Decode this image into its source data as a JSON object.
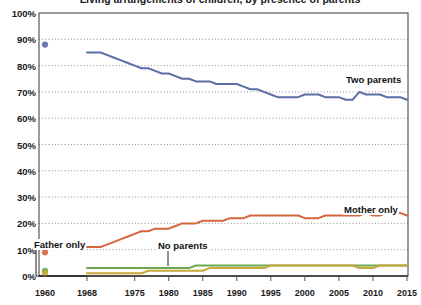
{
  "title": "Living arrangements of children, by presence of parents",
  "axes": {
    "y_ticks": [
      "100%",
      "90%",
      "80%",
      "70%",
      "60%",
      "50%",
      "40%",
      "30%",
      "20%",
      "10%",
      "0%"
    ],
    "x_ticks": [
      "1960",
      "1968",
      "1975",
      "1980",
      "1985",
      "1990",
      "1995",
      "2000",
      "2005",
      "2010",
      "2015"
    ]
  },
  "annotations": {
    "two_parents": "Two parents",
    "mother_only": "Mother only",
    "father_only": "Father only",
    "no_parents": "No parents"
  },
  "colors": {
    "two_parents": "#5b6ea6",
    "mother_only": "#d4673f",
    "father_only": "#c9a63a",
    "no_parents": "#6aa84f",
    "grid": "#7a7a7a",
    "axis": "#4a4a4a"
  },
  "chart_data": {
    "type": "line",
    "title": "Living arrangements of children, by presence of parents",
    "xlabel": "",
    "ylabel": "Percent of children",
    "ylim": [
      0,
      100
    ],
    "grid": true,
    "legend": "inline-annotations",
    "x_axis_ticks": [
      1960,
      1968,
      1975,
      1980,
      1985,
      1990,
      1995,
      2000,
      2005,
      2010,
      2015
    ],
    "y_axis_ticks": [
      0,
      10,
      20,
      30,
      40,
      50,
      60,
      70,
      80,
      90,
      100
    ],
    "note": "1960 values shown as isolated markers; continuous series begin in 1968",
    "isolated_points_1960": [
      {
        "series": "Two parents",
        "x": 1960,
        "y": 88
      },
      {
        "series": "Mother only",
        "x": 1960,
        "y": 9
      },
      {
        "series": "No parents",
        "x": 1960,
        "y": 2
      },
      {
        "series": "Father only",
        "x": 1960,
        "y": 1
      }
    ],
    "x": [
      1968,
      1969,
      1970,
      1971,
      1972,
      1973,
      1974,
      1975,
      1976,
      1977,
      1978,
      1979,
      1980,
      1981,
      1982,
      1983,
      1984,
      1985,
      1986,
      1987,
      1988,
      1989,
      1990,
      1991,
      1992,
      1993,
      1994,
      1995,
      1996,
      1997,
      1998,
      1999,
      2000,
      2001,
      2002,
      2003,
      2004,
      2005,
      2006,
      2007,
      2008,
      2009,
      2010,
      2011,
      2012,
      2013,
      2014,
      2015
    ],
    "series": [
      {
        "name": "Two parents",
        "color": "#5b6ea6",
        "values": [
          85,
          85,
          85,
          84,
          83,
          82,
          81,
          80,
          79,
          79,
          78,
          77,
          77,
          76,
          75,
          75,
          74,
          74,
          74,
          73,
          73,
          73,
          73,
          72,
          71,
          71,
          70,
          69,
          68,
          68,
          68,
          68,
          69,
          69,
          69,
          68,
          68,
          68,
          67,
          67,
          70,
          69,
          69,
          69,
          68,
          68,
          68,
          67
        ]
      },
      {
        "name": "Mother only",
        "color": "#d4673f",
        "values": [
          11,
          11,
          11,
          12,
          13,
          14,
          15,
          16,
          17,
          17,
          18,
          18,
          18,
          19,
          20,
          20,
          20,
          21,
          21,
          21,
          21,
          22,
          22,
          22,
          23,
          23,
          23,
          23,
          23,
          23,
          23,
          23,
          22,
          22,
          22,
          23,
          23,
          23,
          23,
          23,
          23,
          24,
          23,
          23,
          24,
          24,
          24,
          23
        ]
      },
      {
        "name": "Father only",
        "color": "#c9a63a",
        "values": [
          1,
          1,
          1,
          1,
          1,
          1,
          1,
          1,
          1,
          2,
          2,
          2,
          2,
          2,
          2,
          2,
          2,
          2,
          3,
          3,
          3,
          3,
          3,
          3,
          3,
          3,
          3,
          4,
          4,
          4,
          4,
          4,
          4,
          4,
          4,
          4,
          4,
          4,
          4,
          4,
          3,
          3,
          3,
          4,
          4,
          4,
          4,
          4
        ]
      },
      {
        "name": "No parents",
        "color": "#6aa84f",
        "values": [
          3,
          3,
          3,
          3,
          3,
          3,
          3,
          3,
          3,
          3,
          3,
          3,
          3,
          3,
          3,
          3,
          4,
          4,
          4,
          4,
          4,
          4,
          4,
          4,
          4,
          4,
          4,
          4,
          4,
          4,
          4,
          4,
          4,
          4,
          4,
          4,
          4,
          4,
          4,
          4,
          4,
          4,
          4,
          4,
          4,
          4,
          4,
          4
        ]
      }
    ]
  }
}
